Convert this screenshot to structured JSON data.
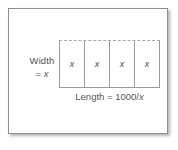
{
  "figure": {
    "kind": "geometry-diagram",
    "caption_text": "",
    "labels": {
      "width_line1": "Width",
      "width_line2_prefix": "= ",
      "width_line2_var": "x",
      "length_prefix": "Length = 1000/",
      "length_var": "x"
    },
    "rectangle": {
      "cell_count": 4,
      "cells": [
        {
          "label": "x"
        },
        {
          "label": "x"
        },
        {
          "label": "x"
        },
        {
          "label": "x"
        }
      ],
      "top_edge_style": "dashed",
      "side_edge_style": "solid",
      "bottom_edge_style": "solid"
    },
    "colors": {
      "panel_border": "#8d8d8d",
      "rect_stroke": "#9a9a9a",
      "rect_dashed_stroke": "#a8a8a8",
      "text": "#555555",
      "cell_text": "#4a4a4a",
      "background": "#ffffff"
    }
  }
}
